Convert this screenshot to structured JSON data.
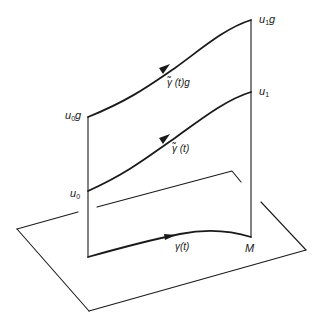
{
  "figure": {
    "stroke_color": "#1a1a1a",
    "background": "#ffffff"
  },
  "labels": {
    "u1g": {
      "base": "u",
      "sub": "1",
      "suffix": "g"
    },
    "u1": {
      "base": "u",
      "sub": "1",
      "suffix": ""
    },
    "u0g": {
      "base": "u",
      "sub": "0",
      "suffix": "g"
    },
    "u0": {
      "base": "u",
      "sub": "0",
      "suffix": ""
    },
    "gamma_tilde_g": "γ̃ (t)g",
    "gamma_tilde": "γ̃ (t)",
    "gamma": "γ(t)",
    "manifold": "M"
  }
}
